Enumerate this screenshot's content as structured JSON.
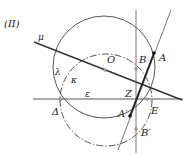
{
  "figure": {
    "label": "(II)",
    "colors": {
      "stroke": "#333333",
      "background": "#ffffff"
    },
    "labels": {
      "mu": "μ",
      "O": "O",
      "B": "B",
      "A": "A",
      "lambda": "λ",
      "kappa": "κ",
      "epsilon": "ε",
      "Z": "Z",
      "Delta": "Δ",
      "E": "E",
      "A_prime": "A′",
      "B_prime": "B′"
    }
  }
}
